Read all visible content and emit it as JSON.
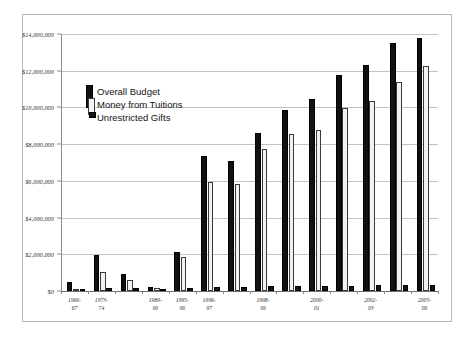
{
  "chart_data": {
    "type": "bar",
    "title": "",
    "subtitle": "",
    "xlabel": "",
    "ylabel": "",
    "ylim": [
      0,
      14000000
    ],
    "ytick_labels": [
      "$14,000,000",
      "$12,000,000",
      "$10,000,000",
      "$8,000,000",
      "$6,000,000",
      "$4,000,000",
      "$2,000,000",
      "$0"
    ],
    "ytick_values": [
      14000000,
      12000000,
      10000000,
      8000000,
      6000000,
      4000000,
      2000000,
      0
    ],
    "grid": true,
    "legend_position": "upper-left-inside",
    "categories": [
      "1966-67",
      "1973-74",
      "1975-76",
      "1989-90",
      "1995-96",
      "1996-97",
      "1997-98",
      "1998-99",
      "1999-00",
      "2000-01",
      "2001-02",
      "2002-03",
      "2003-04",
      "2005-06"
    ],
    "tick_label_visible": [
      true,
      true,
      false,
      true,
      true,
      true,
      false,
      true,
      false,
      true,
      false,
      true,
      false,
      true
    ],
    "axis_tick_labels": [
      "1966-67",
      "1973-74",
      "1975-76",
      "1989-90",
      "1995-96",
      "1997-98",
      "1999-00",
      "2001-02",
      "2003-04",
      "2005-06"
    ],
    "series": [
      {
        "name": "Overall Budget",
        "pattern": "black-dotted",
        "color": "#111111",
        "values": [
          500000,
          1950000,
          900000,
          200000,
          2150000,
          7350000,
          7100000,
          8600000,
          9850000,
          10450000,
          11750000,
          12300000,
          13500000,
          13800000
        ]
      },
      {
        "name": "Money from Tuitions",
        "pattern": "light-dotted",
        "color": "#f2f2f2",
        "values": [
          130000,
          1050000,
          620000,
          160000,
          1850000,
          5950000,
          5850000,
          7750000,
          8550000,
          8750000,
          9950000,
          10350000,
          11400000,
          12250000
        ]
      },
      {
        "name": "Unrestricted Gifts",
        "pattern": "solid-black",
        "color": "#161616",
        "values": [
          90000,
          150000,
          140000,
          110000,
          180000,
          220000,
          230000,
          250000,
          270000,
          280000,
          300000,
          310000,
          330000,
          350000
        ]
      }
    ]
  },
  "legend": {
    "items": [
      {
        "label": "Overall Budget"
      },
      {
        "label": "Money from Tuitions"
      },
      {
        "label": "Unrestricted Gifts"
      }
    ]
  }
}
